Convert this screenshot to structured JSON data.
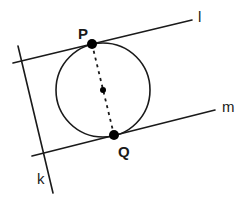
{
  "diagram": {
    "lines": [
      {
        "id": "l",
        "label": "l"
      },
      {
        "id": "m",
        "label": "m"
      },
      {
        "id": "k",
        "label": "k"
      }
    ],
    "points": [
      {
        "id": "P",
        "label": "P"
      },
      {
        "id": "Q",
        "label": "Q"
      },
      {
        "id": "O",
        "label": ""
      }
    ],
    "segments": [
      {
        "from": "P",
        "to": "Q",
        "style": "dashed"
      }
    ],
    "circle": {
      "center": "O",
      "tangent_at": [
        "P",
        "Q"
      ]
    },
    "colors": {
      "stroke": "#1a1a1a",
      "point": "#000000",
      "background": "#ffffff"
    }
  }
}
